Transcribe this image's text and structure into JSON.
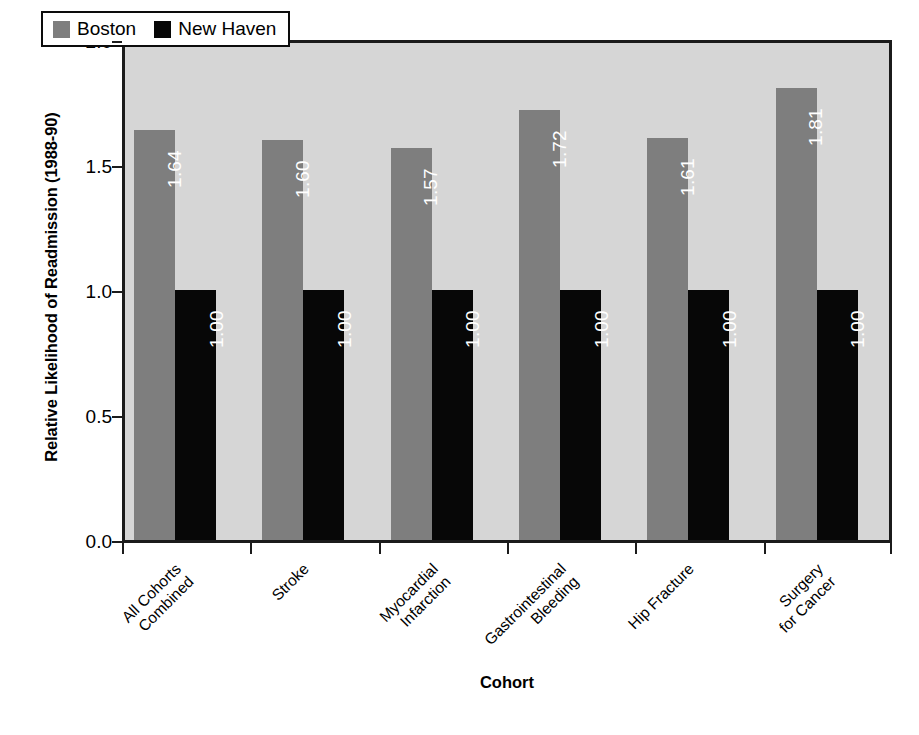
{
  "chart_data": {
    "type": "bar",
    "title": "",
    "subtitle": "",
    "xlabel": "Cohort",
    "ylabel": "Relative Likelihood of Readmission (1988-90)",
    "ylim": [
      0.0,
      2.0
    ],
    "yticks": [
      "0.0",
      "0.5",
      "1.0",
      "1.5",
      "2.0"
    ],
    "ytick_values": [
      0.0,
      0.5,
      1.0,
      1.5,
      2.0
    ],
    "grid": false,
    "legend_position": "top-left-inside",
    "categories": [
      "All Cohorts Combined",
      "Stroke",
      "Myocardial Infarction",
      "Gastrointestinal Bleeding",
      "Hip Fracture",
      "Surgery for Cancer"
    ],
    "category_lines": [
      [
        "All Cohorts",
        "Combined"
      ],
      [
        "Stroke",
        ""
      ],
      [
        "Myocardial",
        "Infarction"
      ],
      [
        "Gastrointestinal",
        "Bleeding"
      ],
      [
        "Hip Fracture",
        ""
      ],
      [
        "Surgery",
        "for Cancer"
      ]
    ],
    "series": [
      {
        "name": "Boston",
        "color": "#7e7e7e",
        "values": [
          1.64,
          1.6,
          1.57,
          1.72,
          1.61,
          1.81
        ],
        "labels": [
          "1.64",
          "1.60",
          "1.57",
          "1.72",
          "1.61",
          "1.81"
        ]
      },
      {
        "name": "New Haven",
        "color": "#070707",
        "values": [
          1.0,
          1.0,
          1.0,
          1.0,
          1.0,
          1.0
        ],
        "labels": [
          "1.00",
          "1.00",
          "1.00",
          "1.00",
          "1.00",
          "1.00"
        ]
      }
    ]
  },
  "legend": {
    "entries": [
      {
        "label": "Boston",
        "color": "#7e7e7e"
      },
      {
        "label": "New Haven",
        "color": "#070707"
      }
    ]
  },
  "colors": {
    "plot_background": "#d6d6d6",
    "page_background": "#ffffff",
    "axis": "#1b1b1b",
    "boston": "#7e7e7e",
    "new_haven": "#070707",
    "value_label": "#ffffff"
  }
}
